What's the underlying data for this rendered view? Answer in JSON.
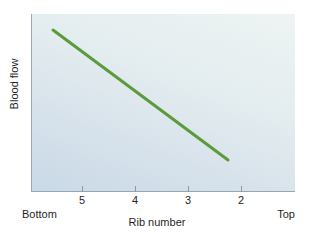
{
  "chart_data": {
    "type": "line",
    "title": "",
    "xlabel": "Rib number",
    "ylabel": "Blood flow",
    "grid": false,
    "legend": null,
    "x_axis": {
      "ticks": [
        {
          "label": "5",
          "x_px": 82
        },
        {
          "label": "4",
          "x_px": 135
        },
        {
          "label": "3",
          "x_px": 188
        },
        {
          "label": "2",
          "x_px": 241
        }
      ],
      "left_endpoint_label": "Bottom",
      "right_endpoint_label": "Top",
      "direction_note": "Rib number decreases left to right"
    },
    "y_axis": {
      "ticks": [],
      "ticklabels": [],
      "note": "Unlabeled relative scale"
    },
    "series": [
      {
        "name": "Blood flow",
        "color": "#5b9b3c",
        "linewidth": 3,
        "x": [
          5.45,
          1.78
        ],
        "y": [
          0.91,
          0.17
        ],
        "points_px": [
          {
            "x": 53,
            "y": 30
          },
          {
            "x": 228,
            "y": 160
          }
        ],
        "trend": "decreasing"
      }
    ],
    "annotations": []
  },
  "style": {
    "panel_gradient_top": "#eef4f3",
    "panel_gradient_bottom": "#c9d9e7",
    "axis_color": "#9aa5ad",
    "text_color": "#1f1f1f",
    "page_background": "#ffffff"
  }
}
